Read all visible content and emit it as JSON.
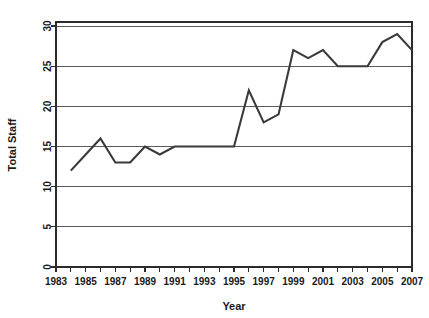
{
  "chart_data": {
    "type": "line",
    "title": "",
    "xlabel": "Year",
    "ylabel": "Total Staff",
    "x": [
      1984,
      1985,
      1986,
      1987,
      1988,
      1989,
      1990,
      1991,
      1992,
      1993,
      1994,
      1995,
      1996,
      1997,
      1998,
      1999,
      2000,
      2001,
      2002,
      2003,
      2004,
      2005,
      2006,
      2007
    ],
    "values": [
      12,
      14,
      16,
      13,
      13,
      15,
      14,
      15,
      15,
      15,
      15,
      15,
      22,
      18,
      19,
      27,
      26,
      27,
      25,
      25,
      25,
      28,
      29,
      27
    ],
    "series": [
      {
        "name": "Total Staff",
        "values": [
          12,
          14,
          16,
          13,
          13,
          15,
          14,
          15,
          15,
          15,
          15,
          15,
          22,
          18,
          19,
          27,
          26,
          27,
          25,
          25,
          25,
          28,
          29,
          27
        ]
      }
    ],
    "xlim": [
      1983,
      2007
    ],
    "ylim": [
      0,
      30.5
    ],
    "x_ticks": [
      1983,
      1984,
      1985,
      1986,
      1987,
      1988,
      1989,
      1990,
      1991,
      1992,
      1993,
      1994,
      1995,
      1996,
      1997,
      1998,
      1999,
      2000,
      2001,
      2002,
      2003,
      2004,
      2005,
      2006,
      2007
    ],
    "x_tick_labels": [
      "1983",
      "",
      "1985",
      "",
      "1987",
      "",
      "1989",
      "",
      "1991",
      "",
      "1993",
      "",
      "1995",
      "",
      "1997",
      "",
      "1999",
      "",
      "2001",
      "",
      "2003",
      "",
      "2005",
      "",
      "2007"
    ],
    "y_ticks": [
      0,
      5,
      10,
      15,
      20,
      25,
      30
    ],
    "y_tick_labels": [
      "0",
      "5",
      "10",
      "15",
      "20",
      "25",
      "30"
    ],
    "grid": true,
    "grid_axis": "y",
    "legend": false,
    "legend_position": "none",
    "line_color": "#3a3a3a",
    "grid_color": "#4a4a4a",
    "axis_color": "#2b2b2b",
    "background_color": "#ffffff"
  }
}
